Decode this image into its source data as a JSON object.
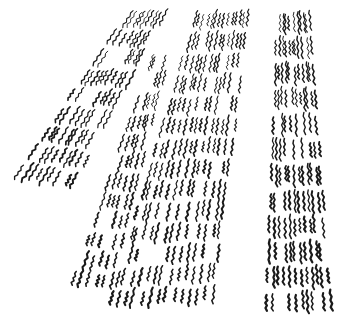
{
  "image": {
    "description": "Ink illustration of diverging strips made of short wavy hatch strokes, receding in perspective",
    "colors": {
      "background": "#ffffff",
      "ink": "#1a1a1a"
    },
    "strips": [
      {
        "name": "strip-far-left",
        "label": "far-left hatched strip"
      },
      {
        "name": "strip-center-left",
        "label": "narrow center-left hatched strip"
      },
      {
        "name": "strip-center-right",
        "label": "wide center-right hatched strip"
      },
      {
        "name": "strip-right",
        "label": "near-vertical right hatched strip"
      }
    ]
  }
}
